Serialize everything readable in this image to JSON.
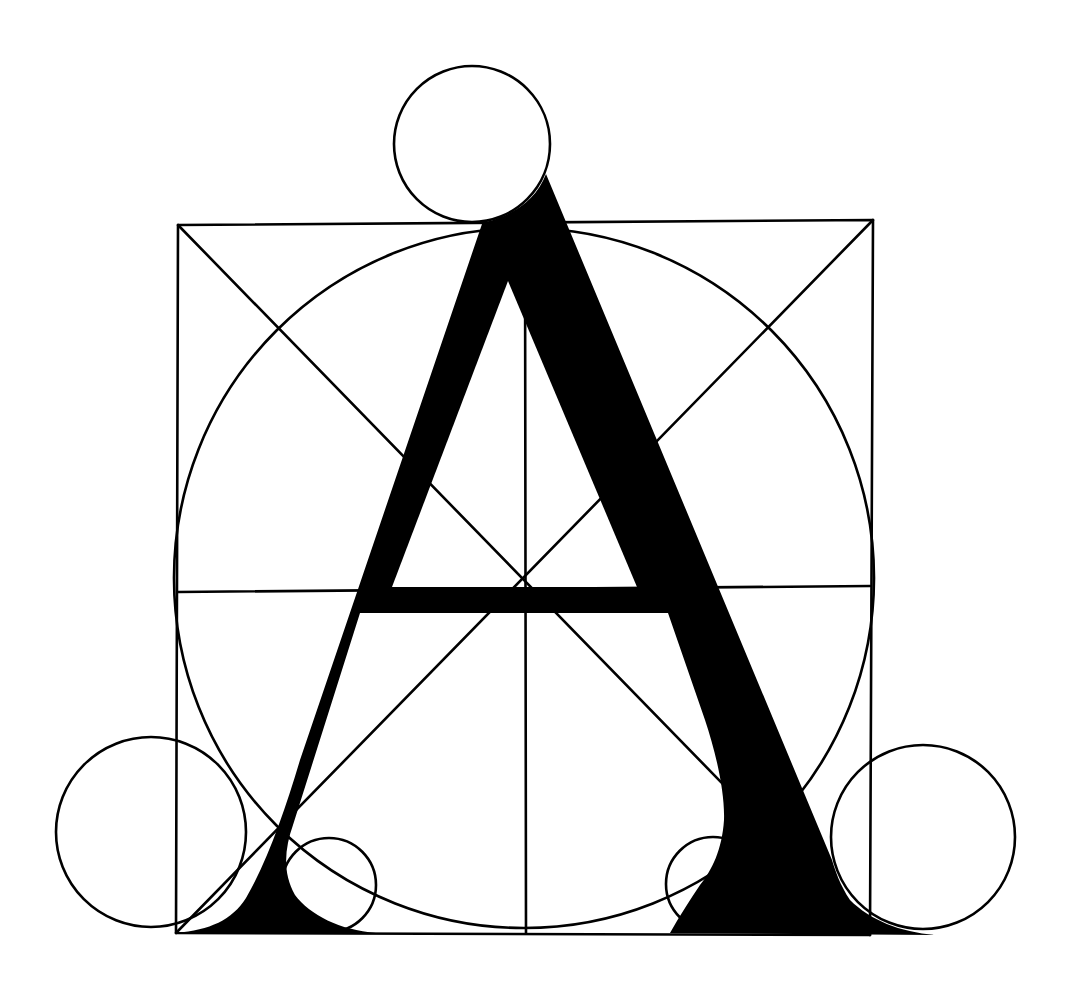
{
  "diagram": {
    "background": "#ffffff",
    "ink": "#000000",
    "stroke_width": 2.6,
    "square": {
      "x1": 178,
      "y1": 224,
      "x2": 872,
      "y2": 933,
      "top_left": [
        178,
        225
      ],
      "top_right": [
        873,
        220
      ],
      "bottom_left": [
        176,
        933
      ],
      "bottom_right": [
        870,
        935
      ]
    },
    "inscribed_circle": {
      "cx": 524,
      "cy": 578,
      "r": 350
    },
    "diagonals": [
      {
        "from": [
          178,
          225
        ],
        "to": [
          870,
          935
        ]
      },
      {
        "from": [
          873,
          220
        ],
        "to": [
          176,
          933
        ]
      }
    ],
    "vertical_axis": {
      "x": 525,
      "y1": 225,
      "y2": 933
    },
    "horizontal_axis": {
      "y_left": 592,
      "y_right": 586,
      "x1": 178,
      "x2": 870
    },
    "circles": [
      {
        "name": "apex-circle",
        "cx": 472,
        "cy": 144,
        "r": 78
      },
      {
        "name": "left-foot-large-circle",
        "cx": 151,
        "cy": 832,
        "r": 95
      },
      {
        "name": "right-foot-large-circle",
        "cx": 923,
        "cy": 837,
        "r": 92
      },
      {
        "name": "left-foot-small-circle",
        "cx": 329,
        "cy": 885,
        "r": 47
      },
      {
        "name": "right-foot-small-circle",
        "cx": 713,
        "cy": 884,
        "r": 47
      }
    ],
    "letter": {
      "glyph": "A",
      "outer_path": "M 546 174 C 536 200 515 214 486 222 L 482 224 L 300 760 C 285 810 268 860 246 898 C 232 920 210 930 176 933 L 376 933 C 340 930 310 915 295 895 C 282 872 285 848 293 825 L 360 613 L 668 613 L 705 720 C 715 750 725 790 724 820 C 722 850 712 870 700 885 C 690 900 680 915 670 933 L 935 935 C 900 932 870 920 850 900 C 840 885 835 870 832 860 Z",
      "counter_path": "M 508 281 L 637 587 L 392 587 Z",
      "crossbar": {
        "y1": 587,
        "y2": 613
      }
    }
  }
}
